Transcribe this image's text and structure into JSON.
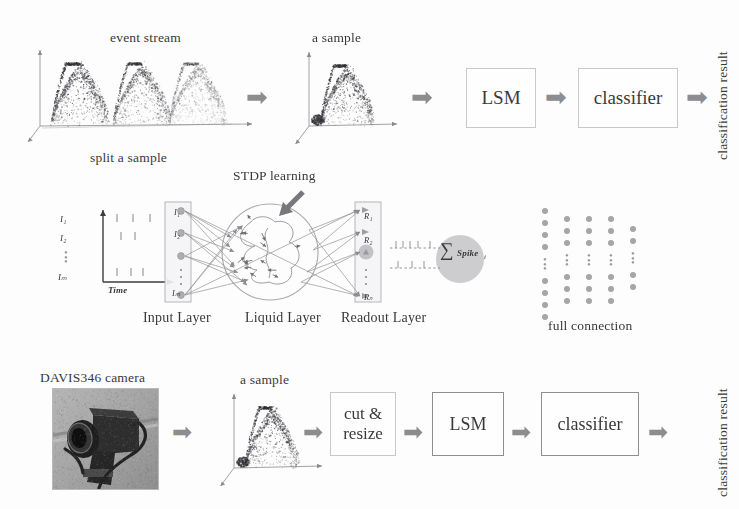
{
  "figure": {
    "background": "#fdfdfd",
    "ink": "#39393c",
    "arrow_color": "#8d8d90"
  },
  "top_row": {
    "event_stream_label": "event stream",
    "split_label": "split a sample",
    "sample_label": "a sample",
    "boxes": [
      {
        "name": "lsm",
        "label": "LSM"
      },
      {
        "name": "classifier",
        "label": "classifier"
      }
    ],
    "arrows": [
      "➡",
      "➡",
      "➡",
      "➡"
    ],
    "result_label": "classification result",
    "event_stream_plot": {
      "type": "scatter",
      "n_humps": 3,
      "hump_opacity": [
        0.95,
        0.72,
        0.42
      ],
      "axes": [
        "x",
        "y",
        "z"
      ],
      "points_per_hump": 900
    },
    "sample_plot": {
      "type": "scatter",
      "n_humps": 1,
      "points": 850
    }
  },
  "middle_row": {
    "stdp_label": "STDP learning",
    "time_axis_label": "Time",
    "input_spike_labels": [
      "I₁",
      "I₂",
      "Iₘ"
    ],
    "readout_labels": [
      "R₁",
      "R₂",
      "Rₙ"
    ],
    "sum_label": "∑",
    "spike_label": "Spike",
    "spike_sub": "i",
    "layer_labels": [
      {
        "name": "input-layer",
        "label": "Input Layer"
      },
      {
        "name": "liquid-layer",
        "label": "Liquid Layer"
      },
      {
        "name": "readout-layer",
        "label": "Readout Layer"
      }
    ],
    "full_connection_label": "full connection",
    "full_connection_grid": {
      "columns": 5,
      "rows_per_column": [
        8,
        6,
        6,
        6,
        4
      ],
      "dot_color": "#a6a6a9"
    },
    "liquid_neurons": 14
  },
  "bottom_row": {
    "camera_label": "DAVIS346 camera",
    "sample_label": "a sample",
    "boxes": [
      {
        "name": "cut-resize",
        "label_line1": "cut &",
        "label_line2": "resize"
      },
      {
        "name": "lsm",
        "label": "LSM"
      },
      {
        "name": "classifier",
        "label": "classifier"
      }
    ],
    "arrows": [
      "➡",
      "➡",
      "➡",
      "➡",
      "➡"
    ],
    "result_label": "classification result",
    "sample_plot": {
      "type": "scatter",
      "n_humps": 1,
      "points": 800
    }
  }
}
